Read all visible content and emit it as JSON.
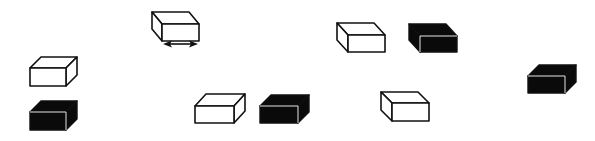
{
  "diagram": {
    "colors": {
      "white_box_fill": "#ffffff",
      "black_box_fill": "#0a0a0a",
      "outline": "#111111",
      "black_box_edge": "#e0e0e0",
      "background": "#ffffff"
    },
    "boxes": [
      {
        "id": "box-1",
        "fill": "white",
        "orientation": "left",
        "x": 162,
        "y": 24,
        "w": 37,
        "h": 17,
        "dx": -10,
        "dy": -12,
        "has_arrow": true
      },
      {
        "id": "box-2",
        "fill": "white",
        "orientation": "right",
        "x": 30,
        "y": 68,
        "w": 36,
        "h": 18,
        "dx": 11,
        "dy": -11,
        "has_arrow": false
      },
      {
        "id": "box-3",
        "fill": "black",
        "orientation": "right",
        "x": 30,
        "y": 112,
        "w": 36,
        "h": 18,
        "dx": 11,
        "dy": -11,
        "has_arrow": false
      },
      {
        "id": "box-4",
        "fill": "white",
        "orientation": "right",
        "x": 195,
        "y": 106,
        "w": 39,
        "h": 17,
        "dx": 11,
        "dy": -12,
        "has_arrow": false
      },
      {
        "id": "box-5",
        "fill": "black",
        "orientation": "right",
        "x": 260,
        "y": 106,
        "w": 38,
        "h": 17,
        "dx": 11,
        "dy": -11,
        "has_arrow": false
      },
      {
        "id": "box-6",
        "fill": "white",
        "orientation": "left",
        "x": 348,
        "y": 35,
        "w": 37,
        "h": 17,
        "dx": -11,
        "dy": -12,
        "has_arrow": false
      },
      {
        "id": "box-7",
        "fill": "black",
        "orientation": "left",
        "x": 420,
        "y": 36,
        "w": 37,
        "h": 16,
        "dx": -11,
        "dy": -12,
        "has_arrow": false
      },
      {
        "id": "box-8",
        "fill": "white",
        "orientation": "left",
        "x": 392,
        "y": 103,
        "w": 37,
        "h": 18,
        "dx": -11,
        "dy": -11,
        "has_arrow": false
      },
      {
        "id": "box-9",
        "fill": "black",
        "orientation": "right",
        "x": 528,
        "y": 76,
        "w": 37,
        "h": 17,
        "dx": 11,
        "dy": -11,
        "has_arrow": false
      }
    ],
    "arrow": {
      "label": "double-headed-arrow",
      "x1": 163,
      "x2": 198,
      "y": 44
    }
  }
}
